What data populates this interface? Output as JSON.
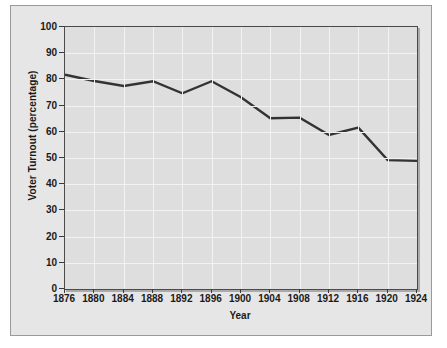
{
  "chart_data": {
    "type": "line",
    "title": "",
    "xlabel": "Year",
    "ylabel": "Voter Turnout (percentage)",
    "x": [
      1876,
      1880,
      1884,
      1888,
      1892,
      1896,
      1900,
      1904,
      1908,
      1912,
      1916,
      1920,
      1924
    ],
    "xtick_labels": [
      "1876",
      "1880",
      "1884",
      "1888",
      "1892",
      "1896",
      "1900",
      "1904",
      "1908",
      "1912",
      "1916",
      "1920",
      "1924"
    ],
    "values": [
      81.8,
      79.4,
      77.5,
      79.3,
      74.7,
      79.3,
      73.2,
      65.2,
      65.4,
      58.8,
      61.6,
      49.2,
      48.9
    ],
    "series": [
      {
        "name": "Voter Turnout",
        "values": [
          81.8,
          79.4,
          77.5,
          79.3,
          74.7,
          79.3,
          73.2,
          65.2,
          65.4,
          58.8,
          61.6,
          49.2,
          48.9
        ]
      }
    ],
    "ytick_labels": [
      "100",
      "90",
      "80",
      "70",
      "60",
      "50",
      "40",
      "30",
      "20",
      "10",
      "0"
    ],
    "yticks": [
      100,
      90,
      80,
      70,
      60,
      50,
      40,
      30,
      20,
      10,
      0
    ],
    "ylim": [
      0,
      100
    ],
    "xlim": [
      1876,
      1924
    ],
    "grid": true,
    "legend": "none",
    "line_color": "#333333",
    "plot_bg_color": "#dedede",
    "figure_bg_color": "#e6e6e6",
    "grid_color": "#f2f2f2",
    "axis_color": "#4a4a4a"
  }
}
